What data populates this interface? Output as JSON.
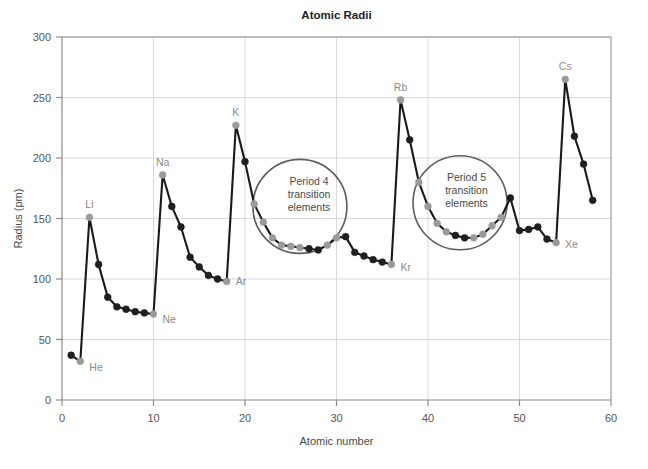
{
  "chart_data": {
    "type": "line",
    "title": "Atomic Radii",
    "xlabel": "Atomic number",
    "ylabel": "Radius (pm)",
    "xlim": [
      0,
      60
    ],
    "ylim": [
      0,
      300
    ],
    "xticks": [
      0,
      10,
      20,
      30,
      40,
      50,
      60
    ],
    "yticks": [
      0,
      50,
      100,
      150,
      200,
      250,
      300
    ],
    "grid": true,
    "legend": "none",
    "series": [
      {
        "name": "Atomic radius",
        "x": [
          1,
          2,
          3,
          4,
          5,
          6,
          7,
          8,
          9,
          10,
          11,
          12,
          13,
          14,
          15,
          16,
          17,
          18,
          19,
          20,
          21,
          22,
          23,
          24,
          25,
          26,
          27,
          28,
          29,
          30,
          31,
          32,
          33,
          34,
          35,
          36,
          37,
          38,
          39,
          40,
          41,
          42,
          43,
          44,
          45,
          46,
          47,
          48,
          49,
          50,
          51,
          52,
          53,
          54,
          55,
          56,
          57,
          58
        ],
        "values": [
          37,
          32,
          151,
          112,
          85,
          77,
          75,
          73,
          72,
          71,
          186,
          160,
          143,
          118,
          110,
          103,
          100,
          98,
          227,
          197,
          162,
          147,
          134,
          128,
          127,
          126,
          125,
          124,
          128,
          134,
          135,
          122,
          119,
          116,
          114,
          112,
          248,
          215,
          180,
          160,
          146,
          139,
          136,
          134,
          134,
          137,
          144,
          151,
          167,
          140,
          141,
          143,
          133,
          130,
          265,
          218,
          195,
          165
        ]
      }
    ],
    "point_styles": {
      "note": "grey markers = alkali/alkaline and noble-gas endpoints and transition metals, dark markers = main group",
      "grey_x": [
        2,
        3,
        10,
        11,
        18,
        19,
        21,
        22,
        23,
        24,
        25,
        26,
        29,
        30,
        36,
        37,
        39,
        40,
        41,
        42,
        45,
        46,
        47,
        48,
        54,
        55
      ],
      "dark_x": [
        1,
        4,
        5,
        6,
        7,
        8,
        9,
        12,
        13,
        14,
        15,
        16,
        17,
        20,
        27,
        28,
        31,
        32,
        33,
        34,
        35,
        38,
        43,
        44,
        49,
        50,
        51,
        52,
        53,
        56,
        57
      ]
    },
    "point_labels": [
      {
        "text": "He",
        "x": 2,
        "value": 32,
        "dx": 9,
        "dy": 10
      },
      {
        "text": "Li",
        "x": 3,
        "value": 151,
        "dx": 0,
        "dy": -9
      },
      {
        "text": "Ne",
        "x": 10,
        "value": 71,
        "dx": 9,
        "dy": 9
      },
      {
        "text": "Na",
        "x": 11,
        "value": 186,
        "dx": 0,
        "dy": -9
      },
      {
        "text": "Ar",
        "x": 18,
        "value": 98,
        "dx": 9,
        "dy": 4
      },
      {
        "text": "K",
        "x": 19,
        "value": 227,
        "dx": 0,
        "dy": -9
      },
      {
        "text": "Kr",
        "x": 36,
        "value": 112,
        "dx": 9,
        "dy": 7
      },
      {
        "text": "Rb",
        "x": 37,
        "value": 248,
        "dx": 0,
        "dy": -9
      },
      {
        "text": "Xe",
        "x": 54,
        "value": 130,
        "dx": 9,
        "dy": 5
      },
      {
        "text": "Cs",
        "x": 55,
        "value": 265,
        "dx": 0,
        "dy": -9
      }
    ],
    "annotations": [
      {
        "id": "period-4-transition",
        "lines": [
          "Period 4",
          "transition",
          "elements"
        ],
        "circle_center_x": 26.0,
        "circle_center_y": 160,
        "circle_radius_px": 47,
        "text_center_x": 27.0,
        "text_center_y": 178
      },
      {
        "id": "period-5-transition",
        "lines": [
          "Period 5",
          "transition",
          "elements"
        ],
        "circle_center_x": 43.5,
        "circle_center_y": 163,
        "circle_radius_px": 47,
        "text_center_x": 44.2,
        "text_center_y": 181
      }
    ],
    "colors": {
      "line": "#1a1a1a",
      "marker_dark": "#1f1f1f",
      "marker_grey": "#9a9a9a",
      "grid": "#d9d9d9",
      "axis": "#8c8c8c",
      "text": "#555555",
      "label_text": "#8a8a8a",
      "annotation_stroke": "#5c5c5c",
      "background": "#ffffff"
    }
  }
}
